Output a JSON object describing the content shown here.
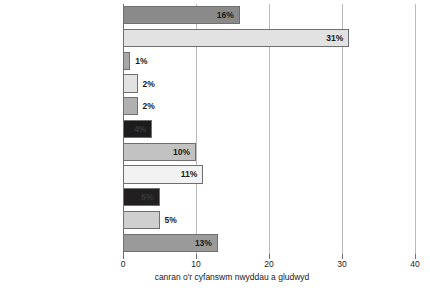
{
  "chart_data": {
    "type": "bar",
    "orientation": "horizontal",
    "title": "",
    "xlabel": "canran o'r cyfanswm nwyddau a gludwyd",
    "ylabel": "",
    "xlim": [
      0,
      40
    ],
    "xticks": [
      0,
      10,
      20,
      30,
      40
    ],
    "xtick_labels": [
      "0",
      "10",
      "20",
      "30",
      "40"
    ],
    "grid": true,
    "grid_axis": "x",
    "legend": "none",
    "value_suffix": "%",
    "categories": [
      "bwyd, diod a thybaco",
      "mwynau a mwynau wedi'u\nprosesu a deunydd adeiladu",
      "cemegion",
      "tecstilau",
      "mwynau a gwastraff metel",
      "glo a chynnyrch petroliwm",
      "gweithgynhyrchion metel",
      "cynnyrch peirianegol",
      "gweithgynhyrchion amrywiol\nheb eu cynnwys",
      "pren, corc a gwydr",
      "amrywiol eraill"
    ],
    "values": [
      16,
      31,
      1,
      2,
      2,
      4,
      10,
      11,
      5,
      5,
      13
    ],
    "value_labels": [
      "16%",
      "31%",
      "1%",
      "2%",
      "2%",
      "4%",
      "10%",
      "11%",
      "5%",
      "5%",
      "13%"
    ],
    "bar_colors": [
      "#8a8a8a",
      "#e2e2e2",
      "#a8a8a8",
      "#e2e2e2",
      "#b0b0b0",
      "#1c1c1c",
      "#c2c2c2",
      "#f2f2f2",
      "#231f20",
      "#cfcfcf",
      "#9a9a9a"
    ],
    "label_inside": [
      true,
      true,
      false,
      false,
      false,
      true,
      true,
      true,
      true,
      false,
      true
    ],
    "label_text_colors": [
      "#1a1a1a",
      "#1a1a1a",
      "#1a1a1a",
      "#1a1a1a",
      "#1a1a1a",
      "#3a3a3a",
      "#1a1a1a",
      "#1a1a1a",
      "#3a3a3a",
      "#1a1a1a",
      "#1a1a1a"
    ],
    "bar_border_color": "#6f6f6f",
    "axis_color": "#6f6f6f",
    "grid_color": "#b9b9b9",
    "background": "#ffffff"
  }
}
